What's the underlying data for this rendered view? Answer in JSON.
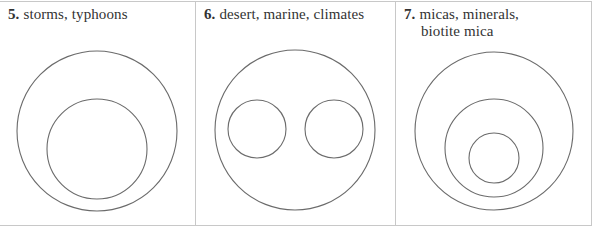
{
  "panels": [
    {
      "number": "5.",
      "text": "storms, typhoons",
      "text_line2": "",
      "circles": [
        {
          "cx": 97,
          "cy": 131,
          "r": 80
        },
        {
          "cx": 97,
          "cy": 149,
          "r": 50
        }
      ]
    },
    {
      "number": "6.",
      "text": "desert, marine, climates",
      "text_line2": "",
      "circles": [
        {
          "cx": 295,
          "cy": 130,
          "r": 80
        },
        {
          "cx": 257,
          "cy": 129,
          "r": 29
        },
        {
          "cx": 334,
          "cy": 129,
          "r": 29
        }
      ]
    },
    {
      "number": "7.",
      "text": "micas, minerals,",
      "text_line2": "biotite mica",
      "circles": [
        {
          "cx": 494,
          "cy": 131,
          "r": 79
        },
        {
          "cx": 494,
          "cy": 148,
          "r": 49
        },
        {
          "cx": 494,
          "cy": 158,
          "r": 25
        }
      ]
    }
  ],
  "colors": {
    "stroke": "#6b6b6b",
    "border": "#c8c8c8",
    "text": "#333333"
  }
}
